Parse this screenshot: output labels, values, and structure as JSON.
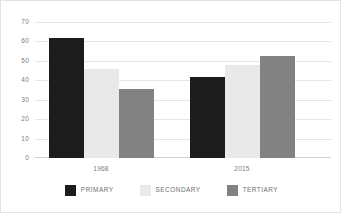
{
  "chart_data": {
    "type": "bar",
    "title": "",
    "xlabel": "",
    "ylabel": "",
    "categories": [
      "1968",
      "2015"
    ],
    "series": [
      {
        "name": "PRIMARY",
        "color": "#1c1c1c",
        "values": [
          62,
          42
        ]
      },
      {
        "name": "SECONDARY",
        "color": "#e9e9e9",
        "values": [
          46,
          48
        ]
      },
      {
        "name": "TERTIARY",
        "color": "#828282",
        "values": [
          36,
          53
        ]
      }
    ],
    "ylim": [
      0,
      70
    ],
    "yticks": [
      0,
      10,
      20,
      30,
      40,
      50,
      60,
      70
    ],
    "ytick_labels": [
      "0",
      "10",
      "20",
      "30",
      "40",
      "50",
      "60",
      "70"
    ],
    "grid": true,
    "legend_position": "bottom"
  },
  "axis": {
    "y_labels": [
      "70",
      "60",
      "50",
      "40",
      "30",
      "20",
      "10",
      "0"
    ],
    "x_labels": [
      "1968",
      "2015"
    ]
  },
  "legend": {
    "items": [
      {
        "label": "PRIMARY",
        "swatch": "primary-swatch"
      },
      {
        "label": "SECONDARY",
        "swatch": "secondary-swatch"
      },
      {
        "label": "TERTIARY",
        "swatch": "tertiary-swatch"
      }
    ]
  }
}
